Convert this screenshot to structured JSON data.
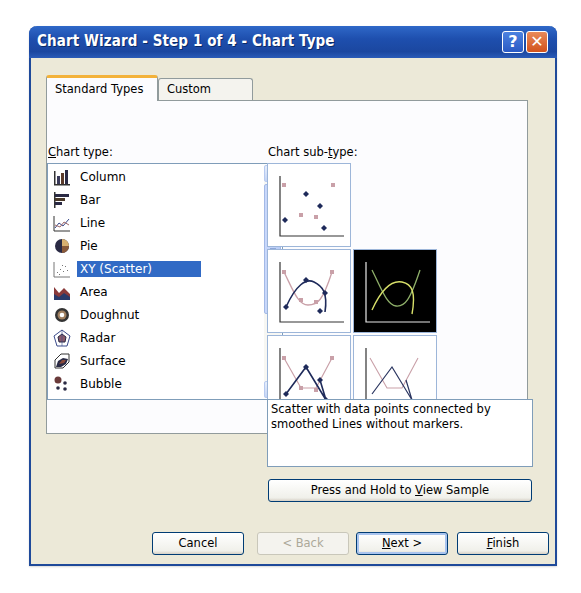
{
  "window": {
    "title": "Chart Wizard - Step 1 of 4 - Chart Type",
    "help_icon": "?",
    "close_icon": "✕"
  },
  "tabs": [
    {
      "label": "Standard Types",
      "active": true
    },
    {
      "label": "Custom Types",
      "active": false
    }
  ],
  "chart_type": {
    "label_prefix": "",
    "label_accel": "C",
    "label_rest": "hart type:",
    "items": [
      {
        "label": "Column",
        "icon": "column-chart-icon"
      },
      {
        "label": "Bar",
        "icon": "bar-chart-icon"
      },
      {
        "label": "Line",
        "icon": "line-chart-icon"
      },
      {
        "label": "Pie",
        "icon": "pie-chart-icon"
      },
      {
        "label": "XY (Scatter)",
        "icon": "scatter-chart-icon",
        "selected": true
      },
      {
        "label": "Area",
        "icon": "area-chart-icon"
      },
      {
        "label": "Doughnut",
        "icon": "doughnut-chart-icon"
      },
      {
        "label": "Radar",
        "icon": "radar-chart-icon"
      },
      {
        "label": "Surface",
        "icon": "surface-chart-icon"
      },
      {
        "label": "Bubble",
        "icon": "bubble-chart-icon"
      }
    ]
  },
  "chart_subtype": {
    "label_prefix": "Chart sub-",
    "label_accel": "t",
    "label_rest": "ype:",
    "items": [
      {
        "name": "scatter-markers-only",
        "selected": false
      },
      {
        "name": "scatter-smoothed-lines-markers",
        "selected": false
      },
      {
        "name": "scatter-smoothed-lines-no-markers",
        "selected": true
      },
      {
        "name": "scatter-straight-lines-markers",
        "selected": false
      },
      {
        "name": "scatter-straight-lines-no-markers",
        "selected": false
      }
    ],
    "description": "Scatter with data points connected by smoothed Lines without markers."
  },
  "sample_button": {
    "prefix": "Press and Hold to ",
    "accel": "V",
    "rest": "iew Sample"
  },
  "footer": {
    "cancel": "Cancel",
    "back": "< Back",
    "next_accel": "N",
    "next_rest": "ext >",
    "finish_accel": "F",
    "finish_rest": "inish"
  },
  "colors": {
    "titlebar": "#1e4fae",
    "selection": "#316ac5",
    "tab_accent": "#f3b23a",
    "dialog_bg": "#ece9d8",
    "series_dark": "#1e2a5a",
    "series_pink": "#c9a0a8",
    "series_green": "#b8d27a"
  }
}
